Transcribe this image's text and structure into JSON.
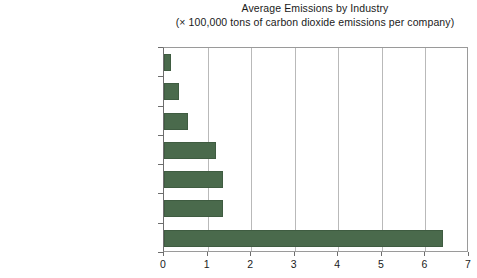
{
  "chart_data": {
    "type": "bar",
    "orientation": "horizontal",
    "title": "Average Emissions by Industry",
    "subtitle": "(× 100,000 tons of carbon dioxide emissions per company)",
    "xlabel": "",
    "ylabel": "",
    "xlim": [
      0,
      7
    ],
    "xticks": [
      "0",
      "1",
      "2",
      "3",
      "4",
      "5",
      "6",
      "7"
    ],
    "grid": "vertical",
    "legend": "none",
    "bar_color": "#4a6a4c",
    "categories": [
      "Healthcare",
      "Personal and household goods",
      "Retail",
      "Industrial goods and services",
      "Automobiles and parts",
      "Food and beverage",
      "Chemicals"
    ],
    "values": [
      0.15,
      0.35,
      0.55,
      1.2,
      1.35,
      1.35,
      6.4
    ]
  }
}
